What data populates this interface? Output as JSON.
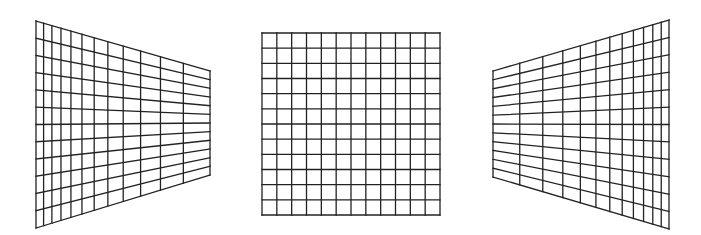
{
  "figure": {
    "stroke_color": "#222222",
    "background": "#ffffff"
  },
  "panels": [
    {
      "name": "left-perspective-grid",
      "cols": 12,
      "rows": 12,
      "corners": {
        "tl": [
          36,
          21
        ],
        "tr": [
          210,
          71
        ],
        "br": [
          210,
          175
        ],
        "bl": [
          36,
          228
        ]
      },
      "vanishing": "right"
    },
    {
      "name": "center-flat-grid",
      "cols": 12,
      "rows": 12,
      "corners": {
        "tl": [
          262,
          33
        ],
        "tr": [
          440,
          33
        ],
        "br": [
          440,
          215
        ],
        "bl": [
          262,
          215
        ]
      },
      "vanishing": "none"
    },
    {
      "name": "right-perspective-grid",
      "cols": 12,
      "rows": 12,
      "corners": {
        "tl": [
          493,
          71
        ],
        "tr": [
          669,
          20
        ],
        "br": [
          669,
          229
        ],
        "bl": [
          493,
          177
        ]
      },
      "vanishing": "left"
    }
  ]
}
